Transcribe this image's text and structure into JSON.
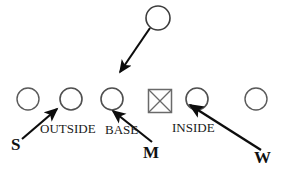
{
  "diagram": {
    "colors": {
      "ink": "#1a1a1a",
      "outline": "#555555",
      "arrow": "#0d0d0d",
      "background": "#ffffff"
    },
    "offense_row": {
      "label": "offensive line",
      "symbols": [
        {
          "kind": "circle",
          "name": "lineman-1",
          "cx": 28,
          "cy": 99,
          "r": 11
        },
        {
          "kind": "circle",
          "name": "lineman-2",
          "cx": 71,
          "cy": 99,
          "r": 11
        },
        {
          "kind": "circle",
          "name": "lineman-3",
          "cx": 112,
          "cy": 99,
          "r": 11
        },
        {
          "kind": "square-x",
          "name": "center",
          "cx": 160,
          "cy": 101,
          "size": 23
        },
        {
          "kind": "circle",
          "name": "lineman-4",
          "cx": 197,
          "cy": 99,
          "r": 11
        },
        {
          "kind": "circle",
          "name": "lineman-5",
          "cx": 256,
          "cy": 99,
          "r": 11
        }
      ]
    },
    "deep_back": {
      "name": "deep-defender",
      "cx": 158,
      "cy": 18,
      "r": 12
    },
    "arrows": [
      {
        "name": "deep-defender-path",
        "from_x": 149,
        "from_y": 29,
        "to_x": 118,
        "to_y": 74
      },
      {
        "name": "strong-safety-path",
        "from_x": 22,
        "from_y": 139,
        "to_x": 60,
        "to_y": 107
      },
      {
        "name": "mike-path",
        "from_x": 152,
        "from_y": 143,
        "to_x": 110,
        "to_y": 110
      },
      {
        "name": "will-path",
        "from_x": 261,
        "from_y": 150,
        "to_x": 189,
        "to_y": 104
      }
    ],
    "route_labels": [
      {
        "name": "label-outside",
        "text": "OUTSIDE",
        "x": 40,
        "y": 122
      },
      {
        "name": "label-base",
        "text": "BASE",
        "x": 105,
        "y": 123
      },
      {
        "name": "label-inside",
        "text": "INSIDE",
        "x": 172,
        "y": 121
      }
    ],
    "player_keys": [
      {
        "name": "key-strong-safety",
        "text": "S",
        "x": 11,
        "y": 136
      },
      {
        "name": "key-mike-linebacker",
        "text": "M",
        "x": 143,
        "y": 144
      },
      {
        "name": "key-will-linebacker",
        "text": "W",
        "x": 254,
        "y": 149
      }
    ]
  }
}
